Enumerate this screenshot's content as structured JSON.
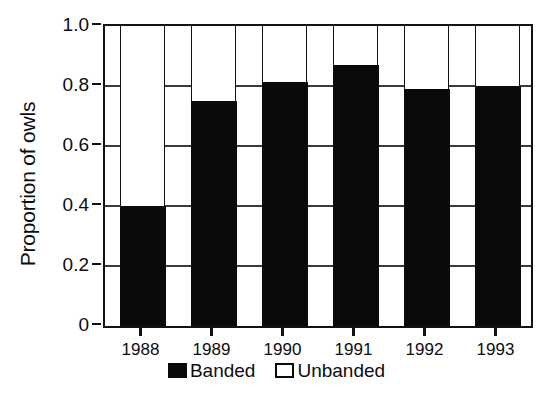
{
  "chart_data": {
    "type": "bar",
    "subtype": "stacked-bar-100percent",
    "title": "",
    "xlabel": "",
    "ylabel": "Proportion of owls",
    "categories": [
      "1988",
      "1989",
      "1990",
      "1991",
      "1992",
      "1993"
    ],
    "series": [
      {
        "name": "Banded",
        "color": "#0a0a0a",
        "values": [
          0.4,
          0.75,
          0.815,
          0.87,
          0.79,
          0.8
        ]
      },
      {
        "name": "Unbanded",
        "color": "#ffffff",
        "values": [
          0.6,
          0.25,
          0.185,
          0.13,
          0.21,
          0.2
        ]
      }
    ],
    "ylim": [
      0,
      1.0
    ],
    "ytick_values": [
      0,
      0.2,
      0.4,
      0.6,
      0.8,
      1.0
    ],
    "ytick_labels": [
      "0",
      "0.2",
      "0.4",
      "0.6",
      "0.8",
      "1.0"
    ],
    "grid": true,
    "grid_axis": "y",
    "legend_position": "bottom-center",
    "legend_entries": [
      "Banded",
      "Unbanded"
    ],
    "frame": true
  },
  "axes": {
    "y_title": "Proportion of owls",
    "y_ticks": [
      {
        "label": "1.0",
        "value": 1.0
      },
      {
        "label": "0.8",
        "value": 0.8
      },
      {
        "label": "0.6",
        "value": 0.6
      },
      {
        "label": "0.4",
        "value": 0.4
      },
      {
        "label": "0.2",
        "value": 0.2
      },
      {
        "label": "0",
        "value": 0.0
      }
    ],
    "x_ticks": [
      {
        "label": "1988"
      },
      {
        "label": "1989"
      },
      {
        "label": "1990"
      },
      {
        "label": "1991"
      },
      {
        "label": "1992"
      },
      {
        "label": "1993"
      }
    ]
  },
  "legend": {
    "items": [
      {
        "label": "Banded",
        "style": "filled"
      },
      {
        "label": "Unbanded",
        "style": "empty"
      }
    ]
  },
  "colors": {
    "banded": "#0a0a0a",
    "unbanded": "#ffffff",
    "axis": "#111111",
    "grid": "#3a3a3a",
    "background": "#ffffff"
  }
}
